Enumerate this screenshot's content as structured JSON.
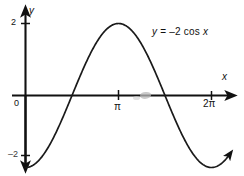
{
  "figure": {
    "background_color": "#ffffff",
    "ink_color": "#111111"
  },
  "labels": {
    "y_axis": "y",
    "x_axis": "x",
    "origin": "0",
    "tick_y_top": "2",
    "tick_y_bottom": "–2",
    "tick_x_pi": "π",
    "tick_x_2pi": "2π",
    "equation_y": "y",
    "equation_eq": "=",
    "equation_rhs": "–2 cos",
    "equation_var": "x"
  },
  "chart_data": {
    "type": "line",
    "title": "",
    "annotations": [
      {
        "text": "y = –2 cos x",
        "x": 4.3,
        "y": 1.55
      }
    ],
    "xlabel": "x",
    "ylabel": "y",
    "xlim": [
      0,
      6.9
    ],
    "ylim": [
      -2.45,
      2.45
    ],
    "xticks": [
      0,
      3.14159,
      6.28319
    ],
    "xticklabels": [
      "0",
      "π",
      "2π"
    ],
    "yticks": [
      2,
      -2
    ],
    "yticklabels": [
      "2",
      "–2"
    ],
    "grid": false,
    "legend": false,
    "series": [
      {
        "name": "y = -2 cos x",
        "formula": "y = -2*cos(x)",
        "amplitude": 2,
        "period": 6.28319,
        "x": [
          0,
          0.3927,
          0.7854,
          1.1781,
          1.5708,
          1.9635,
          2.3562,
          2.7489,
          3.14159,
          3.5343,
          3.927,
          4.3197,
          4.7124,
          5.1051,
          5.4978,
          5.8905,
          6.28319,
          6.6759,
          6.9
        ],
        "y": [
          -2,
          -1.8478,
          -1.4142,
          -0.7654,
          0,
          0.7654,
          1.4142,
          1.8478,
          2,
          1.8478,
          1.4142,
          0.7654,
          0,
          -0.7654,
          -1.4142,
          -1.8478,
          -2,
          -1.8478,
          -1.7
        ]
      }
    ],
    "key_points": [
      {
        "label": "minimum",
        "x": 0,
        "y": -2
      },
      {
        "label": "x-intercept",
        "x": 1.5708,
        "y": 0
      },
      {
        "label": "maximum",
        "x": 3.14159,
        "y": 2
      },
      {
        "label": "x-intercept",
        "x": 4.7124,
        "y": 0
      },
      {
        "label": "minimum",
        "x": 6.28319,
        "y": -2
      }
    ]
  }
}
